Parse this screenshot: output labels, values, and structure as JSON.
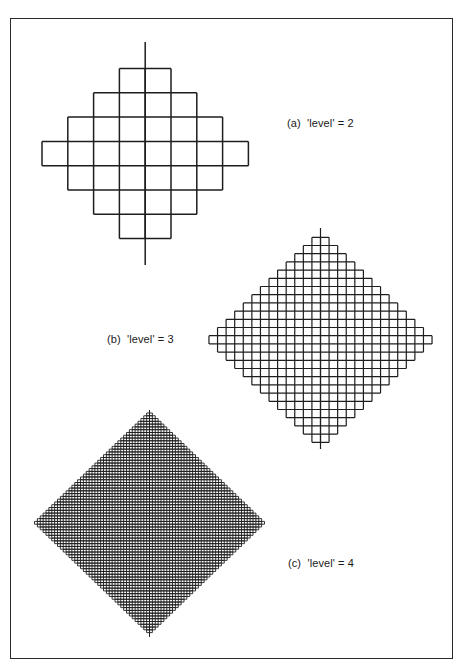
{
  "figures": [
    {
      "id": "a",
      "label": "(a)  'level' = 2",
      "level": 2,
      "label_pos": {
        "x": 287,
        "y": 117
      },
      "center_x": 145.2,
      "top_y": 68.5,
      "cell_w": 25.8,
      "cell_h": 24.3,
      "row_cells": [
        2,
        4,
        6,
        8,
        6,
        4,
        2
      ],
      "axis": {
        "top": 42,
        "bottom": 265
      },
      "stroke_width": 1.5
    },
    {
      "id": "b",
      "label": "(b)  'level' = 3",
      "level": 3,
      "label_pos": {
        "x": 107,
        "y": 333
      },
      "center_x": 320.5,
      "top_y": 237.3,
      "cell_w": 8.58,
      "cell_h": 8.2,
      "row_cells": [
        2,
        4,
        6,
        8,
        10,
        12,
        14,
        16,
        18,
        20,
        22,
        24,
        26,
        24,
        22,
        20,
        18,
        16,
        14,
        12,
        10,
        8,
        6,
        4,
        2
      ],
      "axis": {
        "top": 228,
        "bottom": 449
      },
      "stroke_width": 1.2
    },
    {
      "id": "c",
      "label": "(c)  'level' = 4",
      "level": 4,
      "label_pos": {
        "x": 288,
        "y": 557
      },
      "center_x": 149.5,
      "top_y": 413,
      "cell_w": 2.875,
      "cell_h": 2.78,
      "row_cells_rule": "2,4,...,80,...,4,2",
      "axis": {
        "top": 410,
        "bottom": 637
      },
      "stroke_width": 0.9
    }
  ],
  "colors": {
    "line": "#1e1e1e",
    "background": "#ffffff",
    "frame": "#2a2a2a"
  }
}
